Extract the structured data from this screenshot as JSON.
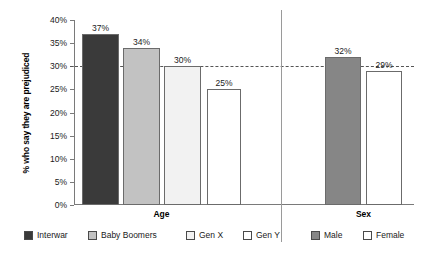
{
  "chart_data": {
    "type": "bar",
    "title": "",
    "subtitle": "",
    "xlabel": "",
    "ylabel": "% who say they are prejudiced",
    "ylim": [
      0,
      40
    ],
    "ytick_labels": [
      "0%",
      "5%",
      "10%",
      "15%",
      "20%",
      "25%",
      "30%",
      "35%",
      "40%"
    ],
    "ytick_values": [
      0,
      5,
      10,
      15,
      20,
      25,
      30,
      35,
      40
    ],
    "grid": false,
    "legend_position": "bottom",
    "reference_line": {
      "value": 30,
      "style": "dashed",
      "color": "#555555"
    },
    "groups": [
      {
        "name": "Age",
        "label": "Age",
        "categories": [
          "Interwar",
          "Baby Boomers",
          "Gen X",
          "Gen Y"
        ],
        "values": [
          37,
          34,
          30,
          25
        ],
        "value_labels": [
          "37%",
          "34%",
          "30%",
          "25%"
        ],
        "colors": [
          "#3a3a3a",
          "#c2c2c2",
          "#f2f2f2",
          "#ffffff"
        ]
      },
      {
        "name": "Sex",
        "label": "Sex",
        "categories": [
          "Male",
          "Female"
        ],
        "values": [
          32,
          29
        ],
        "value_labels": [
          "32%",
          "29%"
        ],
        "colors": [
          "#868686",
          "#ffffff"
        ]
      }
    ],
    "legend": [
      {
        "label": "Interwar",
        "color": "#3a3a3a"
      },
      {
        "label": "Baby Boomers",
        "color": "#c2c2c2"
      },
      {
        "label": "Gen X",
        "color": "#f2f2f2"
      },
      {
        "label": "Gen Y",
        "color": "#ffffff"
      },
      {
        "label": "Male",
        "color": "#868686"
      },
      {
        "label": "Female",
        "color": "#ffffff"
      }
    ]
  }
}
